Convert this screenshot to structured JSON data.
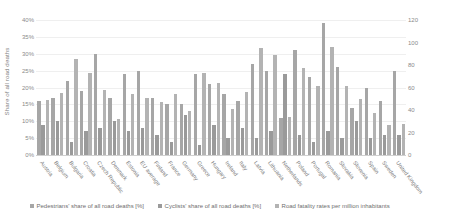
{
  "chart_data": {
    "type": "bar",
    "title": "",
    "xlabel": "",
    "ylabel": "Share of all road deaths",
    "y2label": "Road fatality rates per million inhabitants",
    "ylim": [
      0,
      40
    ],
    "y2lim": [
      0,
      120
    ],
    "grid": true,
    "legend_position": "bottom",
    "yticks": [
      "0%",
      "5%",
      "10%",
      "15%",
      "20%",
      "25%",
      "30%",
      "35%",
      "40%"
    ],
    "y2ticks": [
      "0",
      "20",
      "40",
      "60",
      "80",
      "100",
      "120"
    ],
    "categories": [
      "Austria",
      "Belgium",
      "Bulgaria",
      "Croatia",
      "Czech Republic",
      "Denmark",
      "Estonia",
      "EU average",
      "Finland",
      "France",
      "Germany",
      "Greece",
      "Hungary",
      "Ireland",
      "Italy",
      "Latvia",
      "Lithuania",
      "Netherlands",
      "Poland",
      "Portugal",
      "Romania",
      "Slovakia",
      "Slovenia",
      "Spain",
      "Sweden",
      "United Kingdom"
    ],
    "series": [
      {
        "name": "Pedestrians' share of all road deaths [%]",
        "axis": "left",
        "color": "#a6a6a6",
        "values": [
          16,
          17,
          22,
          19,
          30,
          17,
          24,
          25,
          17,
          15,
          15,
          24,
          21,
          18,
          16,
          27,
          25,
          11,
          31,
          23,
          39,
          26,
          14,
          20,
          16,
          25
        ]
      },
      {
        "name": "Cyclists' share of all road deaths [%]",
        "axis": "left",
        "color": "#9a9a9a",
        "values": [
          9,
          10,
          4,
          7,
          8,
          10,
          7,
          8,
          6,
          4,
          12,
          3,
          9,
          5,
          8,
          5,
          7,
          24,
          6,
          4,
          7,
          5,
          10,
          5,
          6,
          6
        ]
      },
      {
        "name": "Road fatality rates per million inhabitants",
        "axis": "right",
        "color": "#b3b3b3",
        "values": [
          49,
          55,
          85,
          73,
          58,
          32,
          54,
          51,
          47,
          54,
          39,
          73,
          64,
          41,
          56,
          95,
          89,
          34,
          77,
          61,
          96,
          61,
          50,
          37,
          27,
          28
        ]
      }
    ]
  },
  "legend": {
    "items": [
      "Pedestrians' share of all road deaths [%]",
      "Cyclists' share of all road deaths [%]",
      "Road fatality rates per million inhabitants"
    ]
  }
}
